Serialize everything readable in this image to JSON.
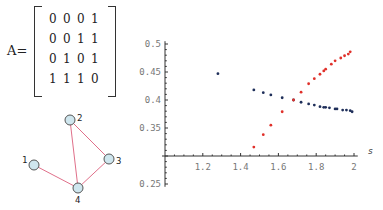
{
  "matrix": {
    "label": "A=",
    "rows": [
      [
        "0",
        "0",
        "0",
        "1"
      ],
      [
        "0",
        "0",
        "1",
        "1"
      ],
      [
        "0",
        "1",
        "0",
        "1"
      ],
      [
        "1",
        "1",
        "1",
        "0"
      ]
    ]
  },
  "graph": {
    "nodes": [
      {
        "id": "1",
        "x": 34,
        "y": 165,
        "label_x": 22,
        "label_y": 163
      },
      {
        "id": "2",
        "x": 70,
        "y": 120,
        "label_x": 77,
        "label_y": 121
      },
      {
        "id": "3",
        "x": 109,
        "y": 159,
        "label_x": 116,
        "label_y": 164
      },
      {
        "id": "4",
        "x": 78,
        "y": 188,
        "label_x": 75,
        "label_y": 203
      }
    ],
    "edges": [
      [
        "1",
        "4"
      ],
      [
        "2",
        "4"
      ],
      [
        "2",
        "3"
      ],
      [
        "3",
        "4"
      ]
    ],
    "node_fill": "#cfe6ee",
    "node_stroke": "#555555",
    "edge_color": "#e0708a"
  },
  "chart_data": {
    "type": "scatter",
    "title": "",
    "xlabel": "s",
    "ylabel": "",
    "xlim": [
      1.0,
      2.0
    ],
    "ylim": [
      0.25,
      0.5
    ],
    "x_axis_crosses_y_at": 0.3,
    "xticks": [
      "1.2",
      "1.4",
      "1.6",
      "1.8",
      "2"
    ],
    "yticks": [
      "0.5",
      "0.45",
      "0.4",
      "0.35",
      "0.25"
    ],
    "grid": false,
    "legend": null,
    "series": [
      {
        "name": "blue",
        "color": "#1f2f5a",
        "points": [
          [
            1.28,
            0.447
          ],
          [
            1.47,
            0.418
          ],
          [
            1.52,
            0.413
          ],
          [
            1.56,
            0.409
          ],
          [
            1.62,
            0.404
          ],
          [
            1.68,
            0.4
          ],
          [
            1.72,
            0.396
          ],
          [
            1.76,
            0.393
          ],
          [
            1.79,
            0.391
          ],
          [
            1.82,
            0.388
          ],
          [
            1.84,
            0.387
          ],
          [
            1.85,
            0.387
          ],
          [
            1.87,
            0.386
          ],
          [
            1.9,
            0.384
          ],
          [
            1.91,
            0.384
          ],
          [
            1.94,
            0.382
          ],
          [
            1.96,
            0.382
          ],
          [
            1.98,
            0.381
          ],
          [
            1.99,
            0.379
          ]
        ]
      },
      {
        "name": "red",
        "color": "#e0302a",
        "points": [
          [
            1.47,
            0.316
          ],
          [
            1.52,
            0.338
          ],
          [
            1.56,
            0.355
          ],
          [
            1.62,
            0.379
          ],
          [
            1.68,
            0.4
          ],
          [
            1.72,
            0.414
          ],
          [
            1.76,
            0.429
          ],
          [
            1.79,
            0.438
          ],
          [
            1.82,
            0.446
          ],
          [
            1.84,
            0.452
          ],
          [
            1.85,
            0.455
          ],
          [
            1.88,
            0.464
          ],
          [
            1.9,
            0.47
          ],
          [
            1.93,
            0.475
          ],
          [
            1.95,
            0.479
          ],
          [
            1.97,
            0.482
          ],
          [
            1.98,
            0.486
          ]
        ]
      }
    ]
  },
  "plot_px": {
    "x0": 165,
    "x1": 354,
    "xmin": 1.0,
    "xmax": 2.0,
    "y_axis_px": 165,
    "x_axis_py": 156,
    "y_top_py": 44,
    "y_top_val": 0.5,
    "y_per_px": 0.0017857
  }
}
